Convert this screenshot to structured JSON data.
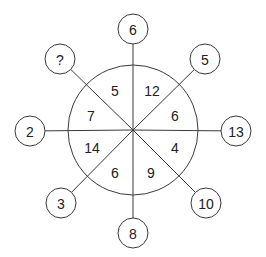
{
  "diagram": {
    "type": "number-wheel-puzzle",
    "center": {
      "x": 133,
      "y": 130
    },
    "circle_radius": 65,
    "node_radius": 15,
    "line_color": "#3a3a3a",
    "text_color": "#222222",
    "outer_nodes": [
      {
        "position": "top",
        "value": "6",
        "x": 133,
        "y": 29
      },
      {
        "position": "top-right",
        "value": "5",
        "x": 205,
        "y": 59
      },
      {
        "position": "right",
        "value": "13",
        "x": 236,
        "y": 131
      },
      {
        "position": "bottom-right",
        "value": "10",
        "x": 206,
        "y": 203
      },
      {
        "position": "bottom",
        "value": "8",
        "x": 133,
        "y": 233
      },
      {
        "position": "bottom-left",
        "value": "3",
        "x": 61,
        "y": 203
      },
      {
        "position": "left",
        "value": "2",
        "x": 30,
        "y": 131
      },
      {
        "position": "top-left",
        "value": "?",
        "x": 60,
        "y": 59
      }
    ],
    "inner_segments": [
      {
        "sector": "top-left-upper",
        "value": "5",
        "x": 115,
        "y": 90
      },
      {
        "sector": "top-right-upper",
        "value": "12",
        "x": 152,
        "y": 90
      },
      {
        "sector": "right-upper",
        "value": "6",
        "x": 175,
        "y": 115
      },
      {
        "sector": "right-lower",
        "value": "4",
        "x": 175,
        "y": 147
      },
      {
        "sector": "bottom-right-lower",
        "value": "9",
        "x": 151,
        "y": 172
      },
      {
        "sector": "bottom-left-lower",
        "value": "6",
        "x": 115,
        "y": 172
      },
      {
        "sector": "left-lower",
        "value": "14",
        "x": 92,
        "y": 147
      },
      {
        "sector": "left-upper",
        "value": "7",
        "x": 91,
        "y": 115
      }
    ]
  }
}
